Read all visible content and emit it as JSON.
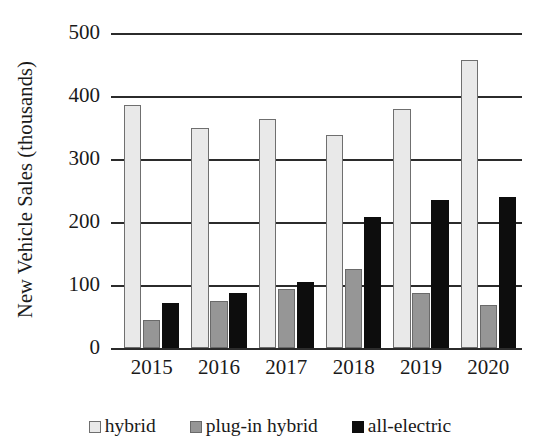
{
  "chart_data": {
    "type": "bar",
    "title": "",
    "xlabel": "",
    "ylabel": "New Vehicle Sales (thousands)",
    "categories": [
      "2015",
      "2016",
      "2017",
      "2018",
      "2019",
      "2020"
    ],
    "series": [
      {
        "name": "hybrid",
        "color": "#e9e9e9",
        "values": [
          385,
          349,
          364,
          338,
          380,
          457
        ]
      },
      {
        "name": "plug-in hybrid",
        "color": "#969696",
        "values": [
          45,
          74,
          93,
          125,
          88,
          68
        ]
      },
      {
        "name": "all-electric",
        "color": "#0d0d0d",
        "values": [
          72,
          88,
          105,
          208,
          235,
          240
        ]
      }
    ],
    "ylim": [
      0,
      500
    ],
    "ytick_values": [
      0,
      100,
      200,
      300,
      400,
      500
    ],
    "ytick_labels": [
      "0",
      "100",
      "200",
      "300",
      "400",
      "500"
    ],
    "grid": true,
    "legend_position": "bottom"
  },
  "axis": {
    "y_title": "New Vehicle Sales (thousands)"
  },
  "legend": {
    "items": [
      {
        "label": "hybrid"
      },
      {
        "label": "plug-in hybrid"
      },
      {
        "label": "all-electric"
      }
    ]
  }
}
